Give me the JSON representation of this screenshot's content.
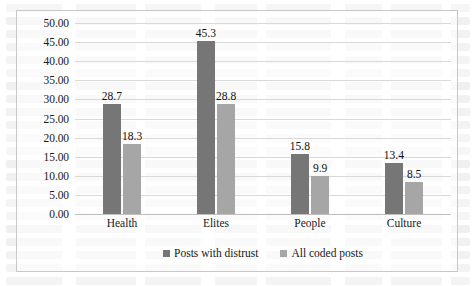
{
  "chart_data": {
    "type": "bar",
    "title": "",
    "subtitle": "",
    "xlabel": "",
    "ylabel": "",
    "categories": [
      "Health",
      "Elites",
      "People",
      "Culture"
    ],
    "series": [
      {
        "name": "Posts with distrust",
        "color": "#767676",
        "values": [
          28.7,
          45.3,
          15.8,
          13.4
        ]
      },
      {
        "name": "All coded posts",
        "color": "#a6a6a6",
        "values": [
          18.3,
          28.8,
          9.9,
          8.5
        ]
      }
    ],
    "ylim": [
      0,
      50
    ],
    "ytick_step": 5,
    "ytick_labels": [
      "50.00",
      "45.00",
      "40.00",
      "35.00",
      "30.00",
      "25.00",
      "20.00",
      "15.00",
      "10.00",
      "5.00",
      "0.00"
    ],
    "ytick_values": [
      50,
      45,
      40,
      35,
      30,
      25,
      20,
      15,
      10,
      5,
      0
    ],
    "data_labels": [
      "28.7",
      "18.3",
      "45.3",
      "28.8",
      "15.8",
      "9.9",
      "13.4",
      "8.5"
    ],
    "grid": true,
    "grid_axis": "y",
    "legend_position": "bottom",
    "border": true,
    "plot_background": "#ffffff",
    "grid_color": "#d9d9d9",
    "border_color": "#c8c8c8",
    "text_color": "#1a1a1a"
  }
}
